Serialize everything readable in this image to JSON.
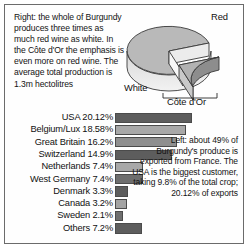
{
  "panel": {
    "intro_caption": "Right: the whole of Burgundy produces three times as much red wine as white. In the Côte d'Or the emphasis is even more on red wine. The average total production is 1.3m hectolitres",
    "side_caption": "Left: about 49% of Burgundy's produce is exported from France. The USA is the biggest customer, taking 9.8% of the total crop; 20.12% of exports"
  },
  "pie": {
    "labels": {
      "red": "Red",
      "white": "White",
      "cote_dor": "Côte d'Or"
    }
  },
  "chart_data": [
    {
      "type": "pie",
      "title": "Burgundy wine production",
      "categories": [
        "Red",
        "White",
        "Côte d'Or"
      ],
      "values": [
        62,
        25,
        13
      ],
      "notes": "3D exploded pie: Red is the large top slice, White the front-left slice, Côte d'Or the exploded front-right wedge",
      "legend": "labels placed around pie"
    },
    {
      "type": "bar",
      "orientation": "horizontal",
      "title": "Burgundy exports by destination",
      "xlabel": "",
      "ylabel": "",
      "xlim": [
        0,
        21
      ],
      "grid": false,
      "categories": [
        "USA",
        "Belgium/Lux",
        "Great Britain",
        "Switzerland",
        "Netherlands",
        "West Germany",
        "Denmark",
        "Canada",
        "Sweden",
        "Others"
      ],
      "values": [
        20.12,
        18.58,
        16.2,
        14.9,
        7.4,
        7.4,
        3.3,
        3.2,
        2.1,
        7.2
      ],
      "rows": [
        {
          "label": "USA 20.12%",
          "value": 20.12,
          "shade": "#5d5d5d"
        },
        {
          "label": "Belgium/Lux 18.58%",
          "value": 18.58,
          "shade": "#a8a8a8"
        },
        {
          "label": "Great Britain 16.2%",
          "value": 16.2,
          "shade": "#8f8f8f"
        },
        {
          "label": "Switzerland 14.9%",
          "value": 14.9,
          "shade": "#5d5d5d"
        },
        {
          "label": "Netherlands 7.4%",
          "value": 7.4,
          "shade": "#a8a8a8"
        },
        {
          "label": "West Germany 7.4%",
          "value": 7.4,
          "shade": "#6e6e6e"
        },
        {
          "label": "Denmark 3.3%",
          "value": 3.3,
          "shade": "#5d5d5d"
        },
        {
          "label": "Canada 3.2%",
          "value": 3.2,
          "shade": "#a3a3a3"
        },
        {
          "label": "Sweden 2.1%",
          "value": 2.1,
          "shade": "#6e6e6e"
        },
        {
          "label": "Others 7.2%",
          "value": 7.2,
          "shade": "#5d5d5d"
        }
      ]
    }
  ]
}
